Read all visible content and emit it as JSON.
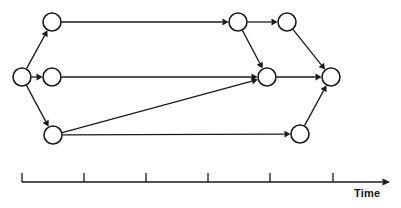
{
  "figure": {
    "type": "directed-graph-timeline",
    "background_color": "#ffffff",
    "line_color": "#1a1a1a",
    "node_fill": "#ffffff"
  },
  "nodes": [
    {
      "id": "n1",
      "name": "node-start",
      "cx": 22,
      "cy": 77,
      "r": 9
    },
    {
      "id": "n2",
      "name": "node-top-left",
      "cx": 52,
      "cy": 22,
      "r": 9
    },
    {
      "id": "n3",
      "name": "node-middle-left",
      "cx": 52,
      "cy": 77,
      "r": 9
    },
    {
      "id": "n4",
      "name": "node-bottom-left",
      "cx": 53,
      "cy": 135,
      "r": 9
    },
    {
      "id": "n5",
      "name": "node-top-mid",
      "cx": 238,
      "cy": 22,
      "r": 9
    },
    {
      "id": "n6",
      "name": "node-top-right",
      "cx": 287,
      "cy": 22,
      "r": 9
    },
    {
      "id": "n7",
      "name": "node-center",
      "cx": 267,
      "cy": 77,
      "r": 9
    },
    {
      "id": "n8",
      "name": "node-end",
      "cx": 331,
      "cy": 77,
      "r": 9
    },
    {
      "id": "n9",
      "name": "node-bottom-right",
      "cx": 300,
      "cy": 134,
      "r": 9
    }
  ],
  "edges": [
    {
      "from": "n1",
      "to": "n2",
      "name": "edge-start-to-top-left"
    },
    {
      "from": "n1",
      "to": "n3",
      "name": "edge-start-to-middle-left"
    },
    {
      "from": "n1",
      "to": "n4",
      "name": "edge-start-to-bottom-left"
    },
    {
      "from": "n2",
      "to": "n5",
      "name": "edge-top-left-to-top-mid"
    },
    {
      "from": "n3",
      "to": "n7",
      "name": "edge-middle-left-to-center"
    },
    {
      "from": "n4",
      "to": "n7",
      "name": "edge-bottom-left-to-center"
    },
    {
      "from": "n4",
      "to": "n9",
      "name": "edge-bottom-left-to-bottom-right"
    },
    {
      "from": "n5",
      "to": "n6",
      "name": "edge-top-mid-to-top-right"
    },
    {
      "from": "n5",
      "to": "n7",
      "name": "edge-top-mid-to-center"
    },
    {
      "from": "n6",
      "to": "n8",
      "name": "edge-top-right-to-end"
    },
    {
      "from": "n7",
      "to": "n8",
      "name": "edge-center-to-end"
    },
    {
      "from": "n9",
      "to": "n8",
      "name": "edge-bottom-right-to-end"
    }
  ],
  "axis": {
    "label": "Time",
    "y": 182,
    "x_start": 22,
    "x_end": 390,
    "arrow": true,
    "tick_height": 9,
    "ticks": [
      22,
      84,
      146,
      208,
      270,
      333
    ],
    "tick_labels": []
  }
}
